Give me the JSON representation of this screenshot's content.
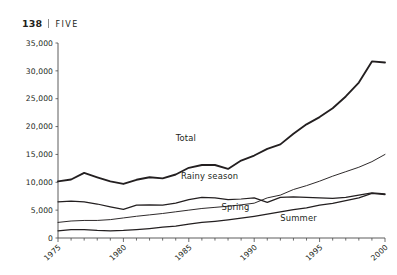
{
  "running_head": {
    "folio": "138",
    "separator": "|",
    "chapter": "FIVE"
  },
  "chart_data": {
    "type": "line",
    "title": "",
    "xlabel": "",
    "ylabel": "",
    "grid": false,
    "legend_position": "inline-labels",
    "xlim": [
      1975,
      2000
    ],
    "ylim": [
      0,
      35000
    ],
    "ytick_labels": [
      "0",
      "5,000",
      "10,000",
      "15,000",
      "20,000",
      "25,000",
      "30,000",
      "35,000"
    ],
    "ytick_values": [
      0,
      5000,
      10000,
      15000,
      20000,
      25000,
      30000,
      35000
    ],
    "xtick_labels": [
      "1975",
      "1980",
      "1985",
      "1990",
      "1995",
      "2000"
    ],
    "xtick_values": [
      1975,
      1980,
      1985,
      1990,
      1995,
      2000
    ],
    "x": [
      1975,
      1976,
      1977,
      1978,
      1979,
      1980,
      1981,
      1982,
      1983,
      1984,
      1985,
      1986,
      1987,
      1988,
      1989,
      1990,
      1991,
      1992,
      1993,
      1994,
      1995,
      1996,
      1997,
      1998,
      1999,
      2000
    ],
    "series": [
      {
        "name": "Total",
        "label": "Total",
        "values": [
          10150,
          10500,
          11700,
          10900,
          10150,
          9700,
          10450,
          10900,
          10700,
          11400,
          12600,
          13100,
          13100,
          12400,
          13900,
          14800,
          16000,
          16800,
          18700,
          20400,
          21700,
          23300,
          25400,
          27900,
          31700,
          31500
        ]
      },
      {
        "name": "Rainy season",
        "label": "Rainy season",
        "values": [
          6500,
          6600,
          6500,
          6100,
          5600,
          5150,
          5900,
          5950,
          5900,
          6250,
          6900,
          7300,
          7200,
          6900,
          7000,
          7200,
          6400,
          7300,
          7400,
          7300,
          7200,
          7100,
          7300,
          7700,
          8100,
          7900
        ]
      },
      {
        "name": "Spring",
        "label": "Spring",
        "values": [
          2800,
          3050,
          3150,
          3150,
          3300,
          3600,
          3900,
          4150,
          4400,
          4700,
          5000,
          5300,
          5500,
          5700,
          5950,
          6250,
          7200,
          7700,
          8700,
          9400,
          10200,
          11100,
          11900,
          12700,
          13700,
          15000
        ]
      },
      {
        "name": "Summer",
        "label": "Summer",
        "values": [
          1300,
          1500,
          1500,
          1350,
          1300,
          1350,
          1500,
          1700,
          1950,
          2150,
          2500,
          2800,
          3000,
          3250,
          3550,
          3900,
          4300,
          4700,
          5100,
          5400,
          5900,
          6200,
          6700,
          7200,
          8000,
          7800
        ]
      }
    ],
    "series_label_positions": [
      {
        "name": "Total",
        "x": 1984.0,
        "y": 17400
      },
      {
        "name": "Rainy season",
        "x": 1984.4,
        "y": 10600
      },
      {
        "name": "Spring",
        "x": 1987.5,
        "y": 5100
      },
      {
        "name": "Summer",
        "x": 1992.0,
        "y": 3000
      }
    ]
  }
}
